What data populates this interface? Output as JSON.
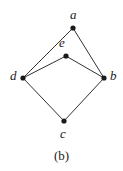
{
  "figure": {
    "caption": "(b)",
    "width": 123,
    "height": 171,
    "background_color": "#ffffff",
    "ink_color": "#1a1a1a"
  },
  "chart_data": {
    "type": "diagram",
    "title": "",
    "subtitle": "",
    "xlabel": "",
    "ylabel": "",
    "grid": false,
    "legend": "none",
    "caption": "(b)",
    "diagram_kind": "undirected-graph",
    "node_radius": 2.6,
    "edge_width": 0.9,
    "nodes": [
      {
        "id": "a",
        "label": "a",
        "x": 73,
        "y": 28,
        "label_x": 70,
        "label_y": 8,
        "label_anchor": "above"
      },
      {
        "id": "e",
        "label": "e",
        "x": 66,
        "y": 56,
        "label_x": 59,
        "label_y": 36,
        "label_anchor": "above-left"
      },
      {
        "id": "d",
        "label": "d",
        "x": 23,
        "y": 78,
        "label_x": 10,
        "label_y": 69,
        "label_anchor": "left"
      },
      {
        "id": "b",
        "label": "b",
        "x": 104,
        "y": 78,
        "label_x": 110,
        "label_y": 69,
        "label_anchor": "right"
      },
      {
        "id": "c",
        "label": "c",
        "x": 64,
        "y": 121,
        "label_x": 60,
        "label_y": 127,
        "label_anchor": "below"
      }
    ],
    "edges": [
      {
        "source": "a",
        "target": "d"
      },
      {
        "source": "a",
        "target": "b"
      },
      {
        "source": "e",
        "target": "d"
      },
      {
        "source": "e",
        "target": "b"
      },
      {
        "source": "d",
        "target": "c"
      },
      {
        "source": "b",
        "target": "c"
      }
    ]
  }
}
